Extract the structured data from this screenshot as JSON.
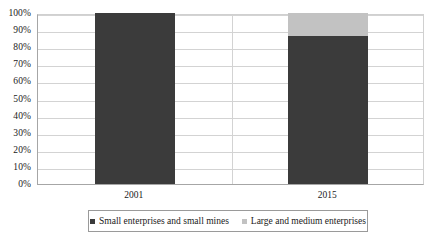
{
  "chart_data": {
    "type": "bar",
    "subtype": "stacked-percent",
    "title": "",
    "subtitle": "",
    "xlabel": "",
    "ylabel": "",
    "categories": [
      "2001",
      "2015"
    ],
    "series": [
      {
        "name": "Small enterprises and small mines",
        "color": "#3b3b3b",
        "values": [
          100,
          86.5
        ]
      },
      {
        "name": "Large and medium enterprises",
        "color": "#c2c2c2",
        "values": [
          0,
          13.5
        ]
      }
    ],
    "ylim": [
      0,
      100
    ],
    "ytick_values": [
      0,
      10,
      20,
      30,
      40,
      50,
      60,
      70,
      80,
      90,
      100
    ],
    "ytick_labels": [
      "0%",
      "10%",
      "20%",
      "30%",
      "40%",
      "50%",
      "60%",
      "70%",
      "80%",
      "90%",
      "100%"
    ],
    "grid": {
      "horizontal": true,
      "vertical": true,
      "color": "#d3d3d3"
    },
    "legend": {
      "position": "bottom",
      "bordered": true,
      "entries": [
        {
          "label": "Small enterprises and small mines",
          "color": "#3b3b3b",
          "marker": "square-swatch"
        },
        {
          "label": "Large and medium enterprises",
          "color": "#c2c2c2",
          "marker": "square-swatch"
        }
      ]
    },
    "annotations": []
  },
  "axis": {
    "y_labels": [
      "100%",
      "90%",
      "80%",
      "70%",
      "60%",
      "50%",
      "40%",
      "30%",
      "20%",
      "10%",
      "0%"
    ],
    "x_labels": [
      "2001",
      "2015"
    ]
  },
  "legend": {
    "items": [
      {
        "label": "Small enterprises and small mines"
      },
      {
        "label": "Large and medium enterprises"
      }
    ]
  },
  "colors": {
    "series_dark": "#3b3b3b",
    "series_light": "#c2c2c2",
    "grid": "#d3d3d3",
    "axis": "#a6a6a6",
    "text": "#1a1a1a",
    "background": "#ffffff"
  }
}
